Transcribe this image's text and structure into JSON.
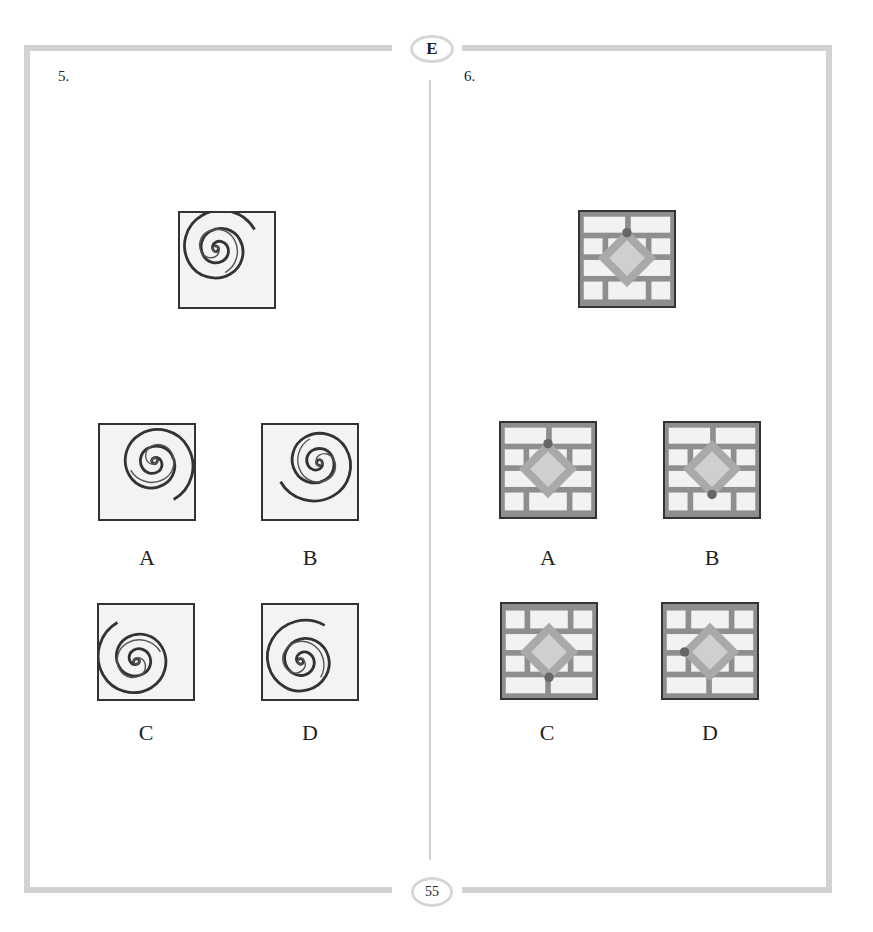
{
  "header": {
    "section_badge": "E"
  },
  "footer": {
    "page_number": "55"
  },
  "questions": [
    {
      "number": "5.",
      "type": "spiral-rotation",
      "prompt_figure": "spiral rotated, center upper-left",
      "options": [
        {
          "label": "A"
        },
        {
          "label": "B"
        },
        {
          "label": "C"
        },
        {
          "label": "D"
        }
      ]
    },
    {
      "number": "6.",
      "type": "brick-diamond-dot",
      "prompt_figure": "diamond on brick wall, dot at top vertex",
      "options": [
        {
          "label": "A"
        },
        {
          "label": "B"
        },
        {
          "label": "C"
        },
        {
          "label": "D"
        }
      ]
    }
  ],
  "colors": {
    "frame": "#d2d2d2",
    "brick_mortar": "#8e8e8e",
    "brick_face": "#f2f2f2",
    "diamond_outer": "#a9a9a9",
    "diamond_inner": "#cfcfcf",
    "dot": "#666666",
    "spiral": "#333333"
  }
}
